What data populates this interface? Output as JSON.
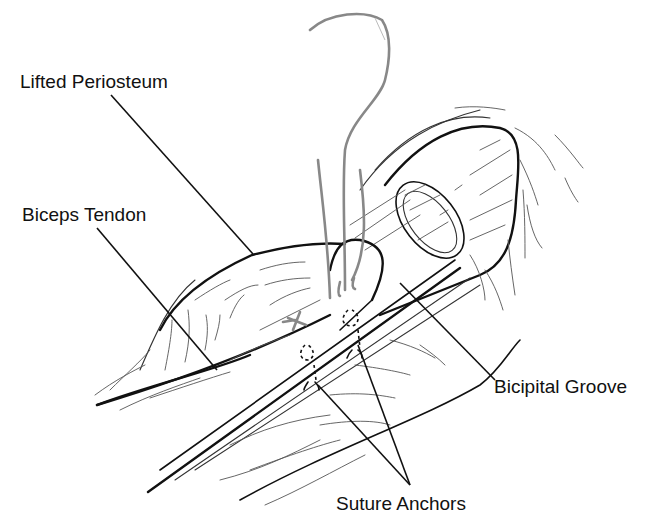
{
  "figure": {
    "labels": {
      "lifted_periosteum": "Lifted Periosteum",
      "biceps_tendon": "Biceps Tendon",
      "bicipital_groove": "Bicipital Groove",
      "suture_anchors": "Suture Anchors"
    },
    "colors": {
      "ink": "#111111",
      "suture": "#888888",
      "background": "#ffffff"
    }
  }
}
